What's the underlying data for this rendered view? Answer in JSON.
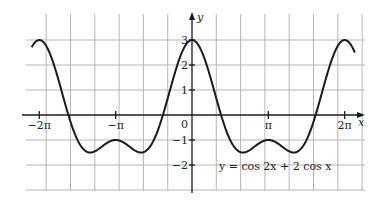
{
  "chart_data": {
    "type": "line",
    "title": "",
    "function": "y = cos 2x + 2 cos x",
    "annotation": "y = cos 2x + 2 cos x",
    "xlabel": "x",
    "ylabel": "y",
    "xlim": [
      -6.6,
      6.7
    ],
    "ylim": [
      -2.5,
      3.5
    ],
    "grid": true,
    "x_tick_labels": [
      "−2π",
      "−π",
      "π",
      "2π"
    ],
    "x_tick_values": [
      -6.2832,
      -3.1416,
      3.1416,
      6.2832
    ],
    "y_tick_labels": [
      "3",
      "2",
      "1",
      "0",
      "−1",
      "−2"
    ],
    "y_tick_values": [
      3,
      2,
      1,
      0,
      -1,
      -2
    ],
    "origin_label": "0",
    "series": [
      {
        "name": "y = cos 2x + 2 cos x",
        "x": [
          -6.6,
          -6.2832,
          -5.5,
          -4.7124,
          -4.1888,
          -3.1416,
          -2.0944,
          -1.5708,
          -0.7854,
          0,
          0.7854,
          1.5708,
          2.0944,
          3.1416,
          4.1888,
          4.7124,
          5.5,
          6.2832,
          6.7
        ],
        "y": [
          2.69,
          3.0,
          1.42,
          -1.0,
          -1.5,
          -1.0,
          -1.5,
          -1.0,
          1.41,
          3.0,
          1.41,
          -1.0,
          -1.5,
          -1.0,
          -1.5,
          -1.0,
          1.42,
          3.0,
          2.44
        ]
      }
    ],
    "key_points": {
      "maxima": [
        [
          -6.2832,
          3
        ],
        [
          0,
          3
        ],
        [
          6.2832,
          3
        ]
      ],
      "local_maxima": [
        [
          -3.1416,
          -1
        ],
        [
          3.1416,
          -1
        ]
      ],
      "minima": [
        [
          -4.1888,
          -1.5
        ],
        [
          -2.0944,
          -1.5
        ],
        [
          2.0944,
          -1.5
        ],
        [
          4.1888,
          -1.5
        ]
      ]
    }
  },
  "layout": {
    "origin_px": [
      192,
      115
    ],
    "x_px_per_unit": 24.3,
    "y_px_per_unit": 25,
    "grid_x_units": [
      -6,
      -5,
      -4,
      -3,
      -2,
      -1,
      1,
      2,
      3,
      4,
      5,
      6,
      7
    ],
    "grid_y_units": [
      -3,
      -2,
      -1,
      1,
      2,
      3
    ],
    "colors": {
      "curve": "#1a1a1a",
      "axis": "#1a1a1a",
      "grid": "#b5b5b5"
    }
  }
}
